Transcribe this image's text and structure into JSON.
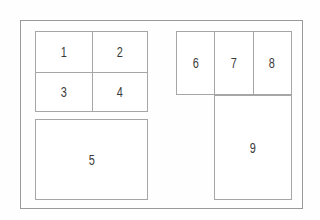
{
  "diagram": {
    "background_color": "#fefefe",
    "frame_border_color": "#9a9a9a",
    "cell_border_color": "#a6a6a6",
    "label_color": "#3a3a3a",
    "regions": {
      "quad": {
        "cell_1": "1",
        "cell_2": "2",
        "cell_3": "3",
        "cell_4": "4"
      },
      "cell_5": "5",
      "triple": {
        "cell_6": "6",
        "cell_7": "7",
        "cell_8": "8"
      },
      "cell_9": "9"
    }
  }
}
